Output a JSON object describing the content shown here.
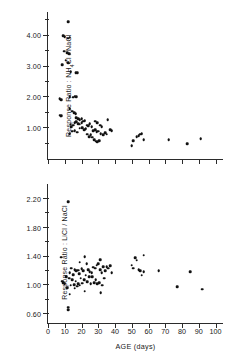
{
  "figure": {
    "caption": "Two stacked scatter plots of taste response ratios versus age"
  },
  "chart_data": [
    {
      "type": "scatter",
      "panel": "top",
      "title": "",
      "xlabel": "AGE (days)",
      "ylabel": "Response Ratio : NH4Cl / NaCl",
      "ylabel_parts": [
        "Response  Ratio :  NH",
        "4",
        "Cl / NaCl"
      ],
      "xlim": [
        0,
        105
      ],
      "ylim": [
        0,
        4.8
      ],
      "grid": false,
      "legend": "none",
      "xticks": [
        0,
        10,
        20,
        30,
        40,
        50,
        60,
        70,
        80,
        90,
        100
      ],
      "xticklabels": [],
      "yticks": [
        1.0,
        2.0,
        3.0,
        4.0
      ],
      "yticklabels": [
        "1.00",
        "2.00",
        "3.00",
        "4.00"
      ],
      "yminorticks": [
        0.5,
        1.5,
        2.5,
        3.5,
        4.5
      ],
      "points": [
        [
          12,
          4.45
        ],
        [
          9,
          4.0
        ],
        [
          10,
          3.96
        ],
        [
          12,
          3.92
        ],
        [
          13,
          3.95
        ],
        [
          9.5,
          3.5
        ],
        [
          11.5,
          3.45
        ],
        [
          12.5,
          3.42
        ],
        [
          10.5,
          3.2
        ],
        [
          8.5,
          3.05
        ],
        [
          12,
          3.12
        ],
        [
          13.5,
          2.82
        ],
        [
          16.5,
          2.8
        ],
        [
          17.5,
          2.8
        ],
        [
          7,
          1.95
        ],
        [
          8,
          1.92
        ],
        [
          13,
          2.02
        ],
        [
          15,
          2.0
        ],
        [
          16,
          2.04
        ],
        [
          17,
          2.02
        ],
        [
          7,
          1.42
        ],
        [
          7.5,
          1.38
        ],
        [
          8,
          1.4
        ],
        [
          13,
          1.62
        ],
        [
          14.5,
          1.55
        ],
        [
          15.5,
          1.5
        ],
        [
          16.5,
          1.46
        ],
        [
          17,
          1.34
        ],
        [
          18,
          1.3
        ],
        [
          19,
          1.28
        ],
        [
          20,
          1.3
        ],
        [
          13.5,
          1.12
        ],
        [
          14,
          1.05
        ],
        [
          15,
          1.1
        ],
        [
          16,
          1.18
        ],
        [
          17,
          1.2
        ],
        [
          18,
          1.15
        ],
        [
          19,
          1.12
        ],
        [
          20,
          1.18
        ],
        [
          21,
          1.22
        ],
        [
          22,
          1.24
        ],
        [
          13,
          0.82
        ],
        [
          14.5,
          0.9
        ],
        [
          16,
          0.92
        ],
        [
          17.5,
          0.86
        ],
        [
          19,
          1.0
        ],
        [
          20.5,
          1.02
        ],
        [
          21.5,
          0.95
        ],
        [
          22.5,
          0.98
        ],
        [
          23,
          1.1
        ],
        [
          24,
          1.08
        ],
        [
          25,
          1.14
        ],
        [
          26,
          1.05
        ],
        [
          23.5,
          0.8
        ],
        [
          24.5,
          0.72
        ],
        [
          25.5,
          0.78
        ],
        [
          26.5,
          0.7
        ],
        [
          27,
          0.92
        ],
        [
          28,
          0.95
        ],
        [
          29,
          0.88
        ],
        [
          30,
          0.9
        ],
        [
          28,
          1.22
        ],
        [
          29.5,
          1.18
        ],
        [
          31,
          1.1
        ],
        [
          32,
          1.05
        ],
        [
          27.5,
          0.62
        ],
        [
          28.5,
          0.58
        ],
        [
          29.5,
          0.55
        ],
        [
          30.5,
          0.6
        ],
        [
          31.5,
          0.82
        ],
        [
          33,
          0.78
        ],
        [
          34,
          0.85
        ],
        [
          35,
          0.8
        ],
        [
          35.5,
          1.28
        ],
        [
          37,
          0.95
        ],
        [
          38,
          0.92
        ],
        [
          50,
          0.42
        ],
        [
          51,
          0.6
        ],
        [
          53,
          0.72
        ],
        [
          54,
          0.75
        ],
        [
          55,
          0.8
        ],
        [
          56,
          0.82
        ],
        [
          57,
          0.62
        ],
        [
          72,
          0.62
        ],
        [
          83,
          0.5
        ],
        [
          91,
          0.65
        ]
      ]
    },
    {
      "type": "scatter",
      "panel": "bottom",
      "title": "",
      "xlabel": "AGE (days)",
      "ylabel": "Response Ratio : LiCl / NaCl",
      "xlim": [
        0,
        105
      ],
      "ylim": [
        0.48,
        2.42
      ],
      "grid": false,
      "legend": "none",
      "xticks": [
        0,
        10,
        20,
        30,
        40,
        50,
        60,
        70,
        80,
        90,
        100
      ],
      "xticklabels": [
        "0",
        "10",
        "20",
        "30",
        "40",
        "50",
        "60",
        "70",
        "80",
        "90",
        "100"
      ],
      "yticks": [
        0.6,
        1.0,
        1.4,
        1.8,
        2.2
      ],
      "yticklabels": [
        "0.60",
        "1.00",
        "1.40",
        "1.80",
        "2.20"
      ],
      "yminorticks": [
        0.8,
        1.2,
        1.6,
        2.0
      ],
      "points": [
        [
          12,
          2.16
        ],
        [
          8,
          1.39
        ],
        [
          22,
          1.4
        ],
        [
          31,
          1.36
        ],
        [
          52,
          1.38
        ],
        [
          53,
          1.35
        ],
        [
          57,
          1.42
        ],
        [
          19,
          1.32
        ],
        [
          23,
          1.3
        ],
        [
          29,
          1.28
        ],
        [
          30,
          1.3
        ],
        [
          33,
          1.26
        ],
        [
          37,
          1.27
        ],
        [
          14,
          1.24
        ],
        [
          16,
          1.22
        ],
        [
          17,
          1.2
        ],
        [
          18,
          1.21
        ],
        [
          20,
          1.23
        ],
        [
          21,
          1.2
        ],
        [
          24,
          1.22
        ],
        [
          25,
          1.19
        ],
        [
          26,
          1.18
        ],
        [
          27,
          1.25
        ],
        [
          28,
          1.24
        ],
        [
          31,
          1.22
        ],
        [
          32,
          1.18
        ],
        [
          34,
          1.2
        ],
        [
          35,
          1.26
        ],
        [
          36,
          1.24
        ],
        [
          38,
          1.18
        ],
        [
          13,
          1.18
        ],
        [
          15,
          1.15
        ],
        [
          18.5,
          1.16
        ],
        [
          22.5,
          1.14
        ],
        [
          26.5,
          1.12
        ],
        [
          11,
          1.12
        ],
        [
          12.5,
          1.1
        ],
        [
          14.5,
          1.08
        ],
        [
          16.5,
          1.06
        ],
        [
          19.5,
          1.1
        ],
        [
          21.5,
          1.08
        ],
        [
          24.5,
          1.12
        ],
        [
          28.5,
          1.08
        ],
        [
          30.5,
          1.04
        ],
        [
          33.5,
          1.1
        ],
        [
          9,
          1.04
        ],
        [
          10,
          1.02
        ],
        [
          13.5,
          1.0
        ],
        [
          15.5,
          1.01
        ],
        [
          17.5,
          0.99
        ],
        [
          18,
          1.02
        ],
        [
          19,
          1.0
        ],
        [
          20.5,
          1.03
        ],
        [
          23.5,
          1.05
        ],
        [
          25.5,
          1.02
        ],
        [
          27.5,
          1.04
        ],
        [
          29.5,
          1.02
        ],
        [
          32.5,
          1.0
        ],
        [
          8.5,
          1.06
        ],
        [
          11.5,
          0.97
        ],
        [
          16,
          0.96
        ],
        [
          13,
          0.88
        ],
        [
          22,
          0.92
        ],
        [
          31.5,
          0.9
        ],
        [
          12,
          0.7
        ],
        [
          12,
          0.66
        ],
        [
          50,
          1.28
        ],
        [
          51,
          1.24
        ],
        [
          54,
          1.22
        ],
        [
          55,
          1.2
        ],
        [
          56,
          1.14
        ],
        [
          57,
          1.19
        ],
        [
          66,
          1.2
        ],
        [
          77,
          0.98
        ],
        [
          85,
          1.19
        ],
        [
          92,
          0.95
        ]
      ]
    }
  ]
}
